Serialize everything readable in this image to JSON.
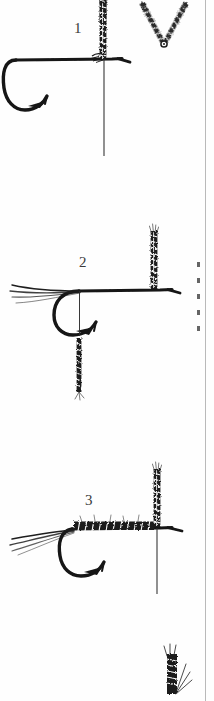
{
  "page": {
    "kind": "scanned-illustration",
    "width": 214,
    "height": 701,
    "background_color": "#fefefe",
    "ink_color": "#1a1a1a",
    "rule_color": "#b9b9b9"
  },
  "steps": [
    {
      "number": "1",
      "caption": "",
      "parts": [
        "hook",
        "tying-thread",
        "wing-post",
        "split-wing-v",
        "thread-bobbin-line"
      ]
    },
    {
      "number": "2",
      "caption": "",
      "parts": [
        "hook",
        "tail-fibers",
        "wing-post",
        "hanging-hackle",
        "tying-thread"
      ]
    },
    {
      "number": "3",
      "caption": "",
      "parts": [
        "hook",
        "tail-fibers",
        "dubbed-body",
        "wing-post",
        "tying-thread"
      ]
    }
  ],
  "partial_figures": [
    {
      "name": "top-cropped-wing-post",
      "position": "top-center"
    },
    {
      "name": "bottom-cropped-hackle",
      "position": "bottom-right"
    }
  ],
  "column_rule": {
    "label": "column-divider",
    "x": 205,
    "color": "#b9b9b9"
  },
  "edge_text_fragments": {
    "label": "cropped-neighbour-column-text",
    "count": 5
  }
}
